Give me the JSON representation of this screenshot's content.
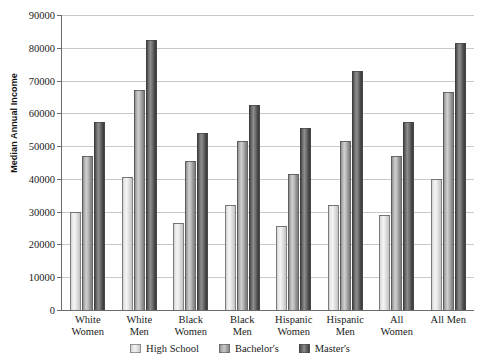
{
  "chart_data": {
    "type": "bar",
    "title": "",
    "xlabel": "",
    "ylabel": "Median Annual Income",
    "ylim": [
      0,
      90000
    ],
    "ytick_step": 10000,
    "grid": true,
    "legend_position": "bottom",
    "categories": [
      "White Women",
      "White Men",
      "Black Women",
      "Black Men",
      "Hispanic Women",
      "Hispanic Men",
      "All Women",
      "All Men"
    ],
    "category_lines": [
      [
        "White",
        "Women"
      ],
      [
        "White",
        "Men"
      ],
      [
        "Black",
        "Women"
      ],
      [
        "Black",
        "Men"
      ],
      [
        "Hispanic",
        "Women"
      ],
      [
        "Hispanic",
        "Men"
      ],
      [
        "All",
        "Women"
      ],
      [
        "All Men",
        ""
      ]
    ],
    "ytick_labels": [
      "90000",
      "80000",
      "70000",
      "60000",
      "50000",
      "40000",
      "30000",
      "20000",
      "10000",
      "0"
    ],
    "ytick_values": [
      90000,
      80000,
      70000,
      60000,
      50000,
      40000,
      30000,
      20000,
      10000,
      0
    ],
    "series": [
      {
        "name": "High School",
        "key": "hs",
        "color": "#e8e8e8",
        "values": [
          30000,
          40500,
          26500,
          32000,
          25500,
          32000,
          29000,
          40000
        ]
      },
      {
        "name": "Bachelor's",
        "key": "ba",
        "color": "#b0b0b0",
        "values": [
          47000,
          67000,
          45500,
          51500,
          41500,
          51500,
          47000,
          66500
        ]
      },
      {
        "name": "Master's",
        "key": "ma",
        "color": "#6a6a6a",
        "values": [
          57500,
          82500,
          54000,
          62500,
          55500,
          73000,
          57500,
          81500
        ]
      }
    ]
  }
}
